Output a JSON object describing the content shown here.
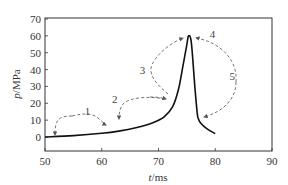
{
  "chart_data": {
    "type": "line",
    "title": "",
    "xlabel": "t/ms",
    "ylabel": "p/MPa",
    "xlim": [
      50,
      90
    ],
    "ylim": [
      -8,
      70
    ],
    "xticks": [
      50,
      60,
      70,
      80,
      90
    ],
    "yticks": [
      0,
      10,
      20,
      30,
      40,
      50,
      60,
      70
    ],
    "grid": false,
    "legend": null,
    "series": [
      {
        "name": "pressure",
        "color": "#111111",
        "x": [
          50,
          55,
          60,
          63,
          66,
          69,
          71,
          72.5,
          73.5,
          74.3,
          75,
          75.3,
          75.7,
          76,
          76.4,
          76.8,
          77,
          77.5,
          78.5,
          80
        ],
        "y": [
          0,
          0.8,
          2.2,
          3.5,
          5.5,
          8.5,
          12,
          18,
          28,
          42,
          55,
          60,
          58,
          48,
          30,
          15,
          11,
          8,
          5,
          2
        ]
      }
    ],
    "annotations": [
      {
        "label": "1",
        "x": 57.5,
        "y": 15.5
      },
      {
        "label": "2",
        "x": 62.3,
        "y": 22.5
      },
      {
        "label": "3",
        "x": 67.2,
        "y": 40
      },
      {
        "label": "4",
        "x": 79.5,
        "y": 61
      },
      {
        "label": "5",
        "x": 83,
        "y": 36
      }
    ]
  },
  "axes": {
    "xlabel_italic": "t",
    "xlabel_unit": "/ms",
    "ylabel_italic": "p",
    "ylabel_unit": "/MPa",
    "xtick_labels": [
      "50",
      "60",
      "70",
      "80",
      "90"
    ],
    "ytick_labels": [
      "0",
      "10",
      "20",
      "30",
      "40",
      "50",
      "60",
      "70"
    ]
  }
}
